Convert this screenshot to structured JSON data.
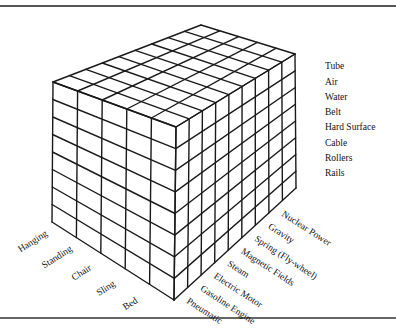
{
  "diagram": {
    "type": "morphological-box",
    "axes": {
      "support": {
        "title": "",
        "values": [
          "Hanging",
          "Standing",
          "Chair",
          "Sling",
          "Bed"
        ]
      },
      "medium": {
        "title": "",
        "values": [
          "Tube",
          "Air",
          "Water",
          "Belt",
          "Hard Surface",
          "Cable",
          "Rollers",
          "Rails"
        ]
      },
      "power_source": {
        "title": "",
        "values": [
          "Pneumatic",
          "Gasoline Engine",
          "Electric Motor",
          "Steam",
          "Magnetic Fields",
          "Spring (Fly-wheel)",
          "Gravity",
          "Nuclear Power"
        ]
      }
    },
    "line_color": "#1a1a1a",
    "background": "#ffffff"
  }
}
